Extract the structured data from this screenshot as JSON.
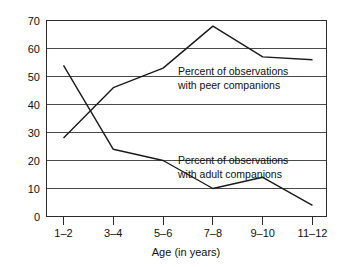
{
  "chart_data": {
    "type": "line",
    "title": "",
    "subtitle": "",
    "xlabel": "Age (in years)",
    "ylabel": "",
    "categories": [
      "1–2",
      "3–4",
      "5–6",
      "7–8",
      "9–10",
      "11–12"
    ],
    "ylim": [
      0,
      70
    ],
    "ytick_step": 10,
    "yticks": [
      "0",
      "10",
      "20",
      "30",
      "40",
      "50",
      "60",
      "70"
    ],
    "grid": "horizontal",
    "legend": "none",
    "series": [
      {
        "name": "Percent of observations with peer companions",
        "values": [
          28,
          46,
          53,
          68,
          57,
          56
        ],
        "color": "#1a1a1a"
      },
      {
        "name": "Percent of observations with adult companions",
        "values": [
          54,
          24,
          20,
          10,
          14,
          4
        ],
        "color": "#1a1a1a"
      }
    ],
    "annotations": [
      {
        "id": "peer-annotation",
        "line1": "Percent of observations",
        "line2": "with peer companions"
      },
      {
        "id": "adult-annotation",
        "line1": "Percent of observations",
        "line2": "with adult companions"
      }
    ]
  },
  "colors": {
    "line": "#1a1a1a",
    "grid": "#4a4a4a",
    "frame": "#2b2b2b",
    "background": "#ffffff",
    "text": "#111111"
  }
}
